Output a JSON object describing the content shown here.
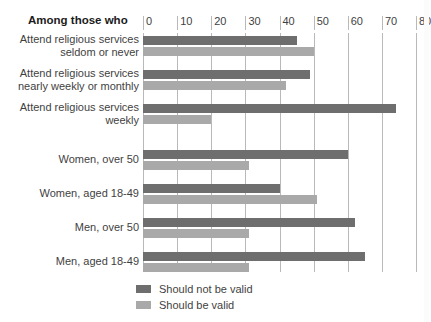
{
  "header": {
    "title": "Among those who"
  },
  "legend": {
    "position": "bottom-left",
    "entries": [
      {
        "label": "Should not be valid",
        "color": "#6e6e6e",
        "key": "should_not_be_valid"
      },
      {
        "label": "Should be valid",
        "color": "#a9a9a9",
        "key": "should_be_valid"
      }
    ]
  },
  "axis": {
    "ticks": [
      0,
      10,
      20,
      30,
      40,
      50,
      60,
      70,
      80
    ],
    "tick_labels": [
      "0",
      "10",
      "20",
      "30",
      "40",
      "50",
      "60",
      "70",
      "80"
    ],
    "min": 0,
    "max": 80,
    "step": 10,
    "grid": true
  },
  "chart_data": {
    "type": "bar",
    "orientation": "horizontal",
    "title": "Among those who",
    "xlabel": "",
    "ylabel": "",
    "xlim": [
      0,
      80
    ],
    "grid": true,
    "legend_position": "bottom-left",
    "categories": [
      "Attend religious services seldom or never",
      "Attend religious services nearly weekly or monthly",
      "Attend religious services weekly",
      "Women, over 50",
      "Women, aged 18-49",
      "Men, over 50",
      "Men, aged 18-49"
    ],
    "series": [
      {
        "name": "Should not be valid",
        "color": "#6e6e6e",
        "values": [
          45,
          49,
          74,
          60,
          40,
          62,
          65
        ]
      },
      {
        "name": "Should be valid",
        "color": "#a9a9a9",
        "values": [
          50,
          42,
          20,
          31,
          51,
          31,
          31
        ]
      }
    ]
  },
  "groups": [
    {
      "label_lines": [
        "Attend religious services",
        "seldom or never"
      ],
      "top": 3,
      "values": {
        "dark": 45,
        "light": 50
      }
    },
    {
      "label_lines": [
        "Attend religious services",
        "nearly weekly or monthly"
      ],
      "top": 37,
      "values": {
        "dark": 49,
        "light": 42
      }
    },
    {
      "label_lines": [
        "Attend religious services",
        "weekly"
      ],
      "top": 71,
      "values": {
        "dark": 74,
        "light": 20
      }
    },
    {
      "label_lines": [
        "Women, over 50"
      ],
      "top": 117,
      "values": {
        "dark": 60,
        "light": 31
      }
    },
    {
      "label_lines": [
        "Women, aged 18-49"
      ],
      "top": 151,
      "values": {
        "dark": 40,
        "light": 51
      }
    },
    {
      "label_lines": [
        "Men, over 50"
      ],
      "top": 185,
      "values": {
        "dark": 62,
        "light": 31
      }
    },
    {
      "label_lines": [
        "Men, aged 18-49"
      ],
      "top": 219,
      "values": {
        "dark": 65,
        "light": 31
      }
    }
  ]
}
